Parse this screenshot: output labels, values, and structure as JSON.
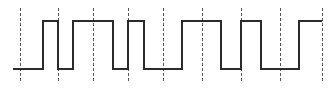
{
  "diagram": {
    "type": "digital-square-wave",
    "background": "#ffffff",
    "wave_color": "#2b2b2b",
    "grid_color": "#555555",
    "levels": {
      "high_y": 21,
      "low_y": 69
    },
    "clock_lines_x": [
      20,
      58,
      93,
      128,
      163,
      202,
      241,
      280,
      322
    ],
    "clock_line_y_range": [
      8,
      82
    ],
    "waveform_points": [
      [
        13,
        69
      ],
      [
        43,
        69
      ],
      [
        43,
        21
      ],
      [
        58,
        21
      ],
      [
        58,
        69
      ],
      [
        73,
        69
      ],
      [
        73,
        21
      ],
      [
        113,
        21
      ],
      [
        113,
        69
      ],
      [
        128,
        69
      ],
      [
        128,
        21
      ],
      [
        144,
        21
      ],
      [
        144,
        69
      ],
      [
        182,
        69
      ],
      [
        182,
        21
      ],
      [
        221,
        21
      ],
      [
        221,
        69
      ],
      [
        241,
        69
      ],
      [
        241,
        21
      ],
      [
        261,
        21
      ],
      [
        261,
        69
      ],
      [
        299,
        69
      ],
      [
        299,
        21
      ],
      [
        322,
        21
      ]
    ],
    "bit_sequence": [
      "0",
      "1",
      "0",
      "1",
      "1",
      "0",
      "1",
      "0",
      "0",
      "1",
      "0",
      "1",
      "0",
      "1"
    ]
  }
}
